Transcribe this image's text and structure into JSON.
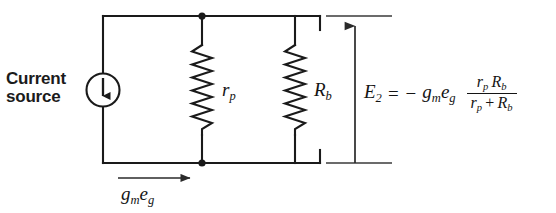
{
  "figure": {
    "background_color": "#ffffff",
    "line_color": "#1a1a1a"
  },
  "labels": {
    "current_source_line1": "Current",
    "current_source_line2": "source",
    "plate_resistance": "r",
    "plate_resistance_sub": "p",
    "load_resistance": "R",
    "load_resistance_sub": "b",
    "source_current_symbol": "g",
    "source_current_sub1": "m",
    "source_current_symbol2": "e",
    "source_current_sub2": "g"
  },
  "equation": {
    "lhs": "E",
    "lhs_sub": "2",
    "equals": "=",
    "minus": "−",
    "gm": "g",
    "gm_sub": "m",
    "eg": "e",
    "eg_sub": "g",
    "numerator_a": "r",
    "numerator_a_sub": "p",
    "numerator_b": "R",
    "numerator_b_sub": "b",
    "denominator_a": "r",
    "denominator_a_sub": "p",
    "denominator_plus": "+",
    "denominator_b": "R",
    "denominator_b_sub": "b",
    "full_text": "E2 = -gm eg  rp Rb / (rp + Rb)"
  },
  "components": {
    "current_source": {
      "name": "current-source",
      "shape": "circle-with-down-arrow",
      "cx": 103,
      "cy": 90,
      "r": 16,
      "arrow_direction": "down"
    },
    "resistor_rp": {
      "name": "resistor-rp",
      "x": 202,
      "y_top": 45,
      "y_bottom": 135,
      "zigzags": 7,
      "orientation": "vertical"
    },
    "resistor_rb": {
      "name": "resistor-rb",
      "x": 295,
      "y_top": 45,
      "y_bottom": 135,
      "zigzags": 7,
      "orientation": "vertical"
    },
    "output_arrow": {
      "name": "e2-voltage-arrow",
      "x": 355,
      "y_from": 163,
      "y_to": 22,
      "direction": "up"
    },
    "current_direction_arrow": {
      "name": "gmeg-current-arrow",
      "y": 178,
      "x_from": 118,
      "x_to": 192,
      "direction": "right"
    },
    "junctions": [
      {
        "name": "junction-top",
        "x": 202,
        "y": 16
      },
      {
        "name": "junction-bottom",
        "x": 202,
        "y": 163
      }
    ],
    "rails": {
      "top_y": 16,
      "bottom_y": 163,
      "left_x": 103,
      "right_x": 320,
      "tick_from": 326,
      "tick_to": 392
    }
  }
}
